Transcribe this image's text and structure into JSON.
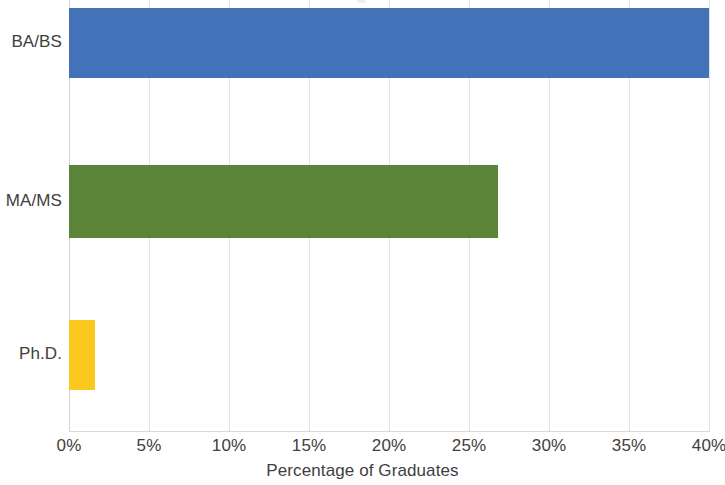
{
  "chart_data": {
    "type": "bar",
    "orientation": "horizontal",
    "title": "",
    "xlabel": "Percentage of Graduates",
    "ylabel": "",
    "categories": [
      "BA/BS",
      "MA/MS",
      "Ph.D."
    ],
    "values": [
      40.0,
      26.8,
      1.6
    ],
    "value_format": "percent",
    "xlim": [
      0,
      40
    ],
    "xticks": [
      0,
      5,
      10,
      15,
      20,
      25,
      30,
      35,
      40
    ],
    "xtick_labels": [
      "0%",
      "5%",
      "10%",
      "15%",
      "20%",
      "25%",
      "30%",
      "35%",
      "40%"
    ],
    "grid": "vertical-only",
    "legend": "none",
    "series": [
      {
        "name": "Percentage of Graduates",
        "points": [
          {
            "category": "BA/BS",
            "value": 40.0,
            "color": "#4472b8"
          },
          {
            "category": "MA/MS",
            "value": 26.8,
            "color": "#5b8438"
          },
          {
            "category": "Ph.D.",
            "value": 1.6,
            "color": "#fbc81e"
          }
        ]
      }
    ],
    "colors": {
      "bar_ba_bs": "#4472b8",
      "bar_ma_ms": "#5b8438",
      "bar_phd": "#fbc81e",
      "gridline": "#e2e2e2",
      "axis_line": "#d9d9d9",
      "text": "#404040",
      "background": "#ffffff"
    }
  },
  "axis": {
    "x_title": "Percentage of Graduates",
    "ticks": [
      {
        "label": "0%"
      },
      {
        "label": "5%"
      },
      {
        "label": "10%"
      },
      {
        "label": "15%"
      },
      {
        "label": "20%"
      },
      {
        "label": "25%"
      },
      {
        "label": "30%"
      },
      {
        "label": "35%"
      },
      {
        "label": "40%"
      }
    ]
  },
  "categories": [
    {
      "label": "BA/BS"
    },
    {
      "label": "MA/MS"
    },
    {
      "label": "Ph.D."
    }
  ]
}
